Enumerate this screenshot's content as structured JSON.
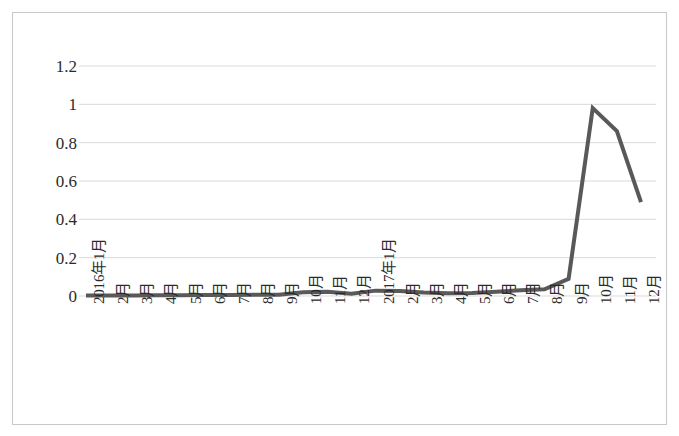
{
  "chart_data": {
    "type": "line",
    "title": "",
    "subtitle": "",
    "xlabel": "",
    "ylabel": "",
    "categories": [
      "2016年1月",
      "2月",
      "3月",
      "4月",
      "5月",
      "6月",
      "7月",
      "8月",
      "9月",
      "10月",
      "11月",
      "12月",
      "2017年1月",
      "2月",
      "3月",
      "4月",
      "5月",
      "6月",
      "7月",
      "8月",
      "9月",
      "10月",
      "11月",
      "12月"
    ],
    "values": [
      0.002,
      0.003,
      0.003,
      0.004,
      0.004,
      0.005,
      0.005,
      0.006,
      0.007,
      0.02,
      0.022,
      0.012,
      0.028,
      0.026,
      0.018,
      0.015,
      0.016,
      0.022,
      0.03,
      0.035,
      0.09,
      0.98,
      0.86,
      0.49
    ],
    "ylim": [
      0,
      1.2
    ],
    "yticks": [
      0,
      0.2,
      0.4,
      0.6,
      0.8,
      1,
      1.2
    ],
    "ytick_labels": [
      "0",
      "0.2",
      "0.4",
      "0.6",
      "0.8",
      "1",
      "1.2"
    ],
    "grid": true,
    "grid_axis": "y",
    "legend": false,
    "legend_position": "none",
    "series_color": "#595959",
    "grid_color": "#d9d9d9",
    "border_color": "#c9c9c9",
    "line_width": 4
  }
}
